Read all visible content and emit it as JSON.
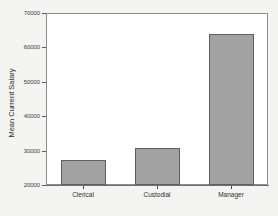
{
  "chart_data": {
    "type": "bar",
    "title": "",
    "xlabel": "",
    "ylabel": "Mean Current Salary",
    "categories": [
      "Clerical",
      "Custodial",
      "Manager"
    ],
    "values": [
      27300,
      30900,
      63900
    ],
    "ylim": [
      20000,
      70000
    ],
    "yticks": [
      20000,
      30000,
      40000,
      50000,
      60000,
      70000
    ],
    "ytick_labels": [
      "20000",
      "30000",
      "40000",
      "50000",
      "60000",
      "70000"
    ],
    "grid": false,
    "legend": null,
    "bar_color": "#a2a2a2",
    "bar_border_color": "#5f5f5f",
    "plot_background": "#ffffff",
    "page_background": "#f4f4f2",
    "axis_color": "#8d8d8d"
  }
}
